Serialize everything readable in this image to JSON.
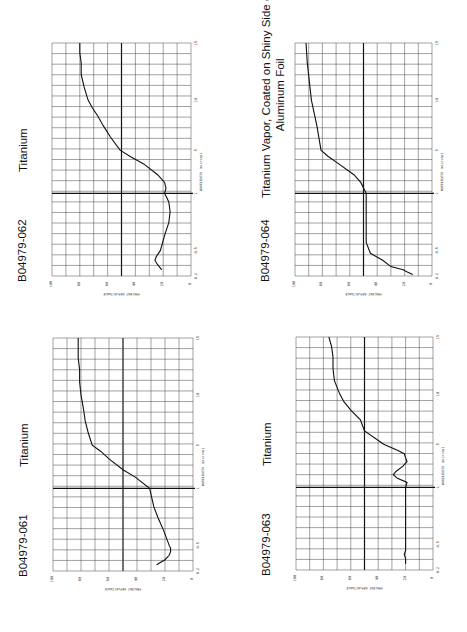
{
  "page": {
    "rotation_deg": -90,
    "background": "#ffffff"
  },
  "charts": [
    {
      "id": "B04979-062",
      "name": "Titanium",
      "name_lines": [
        "Titanium"
      ],
      "box": {
        "left": 52,
        "top": 43,
        "right": 191,
        "bottom": 276
      },
      "points": [
        [
          0.25,
          21
        ],
        [
          0.3,
          24
        ],
        [
          0.35,
          26
        ],
        [
          0.4,
          25
        ],
        [
          0.5,
          22
        ],
        [
          0.6,
          19
        ],
        [
          0.7,
          16
        ],
        [
          0.8,
          15
        ],
        [
          0.9,
          16
        ],
        [
          1.0,
          19
        ],
        [
          1.2,
          18
        ],
        [
          1.5,
          19
        ],
        [
          2,
          24
        ],
        [
          3,
          34
        ],
        [
          4,
          44
        ],
        [
          5,
          51
        ],
        [
          6,
          58
        ],
        [
          7,
          63
        ],
        [
          8,
          67
        ],
        [
          9,
          71
        ],
        [
          10,
          74
        ],
        [
          11,
          77
        ],
        [
          12,
          79
        ],
        [
          13,
          79
        ],
        [
          14,
          80
        ],
        [
          15,
          80
        ]
      ]
    },
    {
      "id": "B04979-064",
      "name": "Titanium Vapor, Coated on Shiny Side of Aluminum Foil",
      "name_lines": [
        "Titanium Vapor, Coated on Shiny Side of",
        "Aluminum Foil"
      ],
      "box": {
        "left": 295,
        "top": 43,
        "right": 432,
        "bottom": 276
      },
      "points": [
        [
          0.21,
          14
        ],
        [
          0.23,
          18
        ],
        [
          0.25,
          21
        ],
        [
          0.28,
          30
        ],
        [
          0.35,
          36
        ],
        [
          0.45,
          45
        ],
        [
          0.55,
          48
        ],
        [
          1.0,
          48
        ],
        [
          1.5,
          52
        ],
        [
          2,
          57
        ],
        [
          3,
          68
        ],
        [
          4,
          76
        ],
        [
          5,
          81
        ],
        [
          7,
          84
        ],
        [
          10,
          88
        ],
        [
          13,
          91
        ],
        [
          15,
          92
        ]
      ]
    },
    {
      "id": "B04979-061",
      "name": "Titanium",
      "name_lines": [
        "Titanium"
      ],
      "box": {
        "left": 53,
        "top": 338,
        "right": 193,
        "bottom": 571
      },
      "points": [
        [
          0.25,
          26
        ],
        [
          0.3,
          20
        ],
        [
          0.35,
          17
        ],
        [
          0.4,
          16
        ],
        [
          0.45,
          16
        ],
        [
          0.5,
          17
        ],
        [
          0.6,
          21
        ],
        [
          0.7,
          25
        ],
        [
          0.8,
          28
        ],
        [
          1.0,
          31
        ],
        [
          1.5,
          41
        ],
        [
          2,
          50
        ],
        [
          3,
          60
        ],
        [
          4,
          66
        ],
        [
          5,
          72
        ],
        [
          6,
          75
        ],
        [
          7,
          77
        ],
        [
          8,
          78
        ],
        [
          9,
          79
        ],
        [
          10,
          80
        ],
        [
          11,
          81
        ],
        [
          12,
          81
        ],
        [
          13,
          82
        ],
        [
          14,
          82
        ],
        [
          15,
          82
        ]
      ]
    },
    {
      "id": "B04979-063",
      "name": "Titanium",
      "name_lines": [
        "Titanium"
      ],
      "box": {
        "left": 296,
        "top": 337,
        "right": 433,
        "bottom": 570
      },
      "points": [
        [
          0.25,
          20
        ],
        [
          0.3,
          20
        ],
        [
          0.35,
          21
        ],
        [
          0.4,
          20
        ],
        [
          0.5,
          20
        ],
        [
          0.7,
          20
        ],
        [
          1.0,
          20
        ],
        [
          1.2,
          19
        ],
        [
          1.4,
          26
        ],
        [
          1.6,
          29
        ],
        [
          1.8,
          27
        ],
        [
          2.2,
          22
        ],
        [
          2.6,
          19
        ],
        [
          3,
          20
        ],
        [
          3.5,
          21
        ],
        [
          4,
          26
        ],
        [
          5,
          36
        ],
        [
          6,
          50
        ],
        [
          7,
          53
        ],
        [
          8,
          60
        ],
        [
          9,
          65
        ],
        [
          10,
          68
        ],
        [
          11,
          72
        ],
        [
          12,
          73
        ],
        [
          13,
          73
        ],
        [
          14,
          74
        ],
        [
          15,
          76
        ]
      ]
    }
  ],
  "axes": {
    "wavelength_label": "WAVELENGTH",
    "wavelength_unit": "(microns)",
    "wavelength_ticks": [
      {
        "v": 0.2,
        "label": "0.2",
        "frac": 0.0
      },
      {
        "v": 0.5,
        "label": "0.5",
        "frac": 0.11
      },
      {
        "v": 1,
        "label": "1",
        "frac": 0.355
      },
      {
        "v": 5,
        "label": "5",
        "frac": 0.54
      },
      {
        "v": 10,
        "label": "10",
        "frac": 0.755
      },
      {
        "v": 15,
        "label": "15",
        "frac": 1.0
      }
    ],
    "reflectance_label": "PERCENT REFLECTANCE",
    "reflectance_ticks": [
      "100",
      "80",
      "60",
      "40",
      "20",
      "0"
    ]
  },
  "chart_data": [
    {
      "type": "line",
      "title": "B04979-062 Titanium",
      "xlabel": "WAVELENGTH (microns)",
      "ylabel": "PERCENT REFLECTANCE",
      "xlim": [
        0.2,
        15
      ],
      "ylim": [
        0,
        100
      ],
      "x_ticks": [
        0.2,
        0.5,
        1,
        5,
        10,
        15
      ],
      "y_ticks": [
        0,
        20,
        40,
        60,
        80,
        100
      ],
      "grid": true,
      "x": [
        0.25,
        0.3,
        0.35,
        0.4,
        0.5,
        0.6,
        0.7,
        0.8,
        0.9,
        1.0,
        1.2,
        1.5,
        2,
        3,
        4,
        5,
        6,
        7,
        8,
        9,
        10,
        11,
        12,
        13,
        14,
        15
      ],
      "y": [
        21,
        24,
        26,
        25,
        22,
        19,
        16,
        15,
        16,
        19,
        18,
        19,
        24,
        34,
        44,
        51,
        58,
        63,
        67,
        71,
        74,
        77,
        79,
        79,
        80,
        80
      ]
    },
    {
      "type": "line",
      "title": "B04979-064 Titanium Vapor, Coated on Shiny Side of Aluminum Foil",
      "xlabel": "WAVELENGTH (microns)",
      "ylabel": "PERCENT REFLECTANCE",
      "xlim": [
        0.2,
        15
      ],
      "ylim": [
        0,
        100
      ],
      "x_ticks": [
        0.2,
        0.5,
        1,
        5,
        10,
        15
      ],
      "y_ticks": [
        0,
        20,
        40,
        60,
        80,
        100
      ],
      "grid": true,
      "x": [
        0.21,
        0.23,
        0.25,
        0.28,
        0.35,
        0.45,
        0.55,
        1.0,
        1.5,
        2,
        3,
        4,
        5,
        7,
        10,
        13,
        15
      ],
      "y": [
        14,
        18,
        21,
        30,
        36,
        45,
        48,
        48,
        52,
        57,
        68,
        76,
        81,
        84,
        88,
        91,
        92
      ]
    },
    {
      "type": "line",
      "title": "B04979-061 Titanium",
      "xlabel": "WAVELENGTH (microns)",
      "ylabel": "PERCENT REFLECTANCE",
      "xlim": [
        0.2,
        15
      ],
      "ylim": [
        0,
        100
      ],
      "x_ticks": [
        0.2,
        0.5,
        1,
        5,
        10,
        15
      ],
      "y_ticks": [
        0,
        20,
        40,
        60,
        80,
        100
      ],
      "grid": true,
      "x": [
        0.25,
        0.3,
        0.35,
        0.4,
        0.45,
        0.5,
        0.6,
        0.7,
        0.8,
        1.0,
        1.5,
        2,
        3,
        4,
        5,
        6,
        7,
        8,
        9,
        10,
        11,
        12,
        13,
        14,
        15
      ],
      "y": [
        26,
        20,
        17,
        16,
        16,
        17,
        21,
        25,
        28,
        31,
        41,
        50,
        60,
        66,
        72,
        75,
        77,
        78,
        79,
        80,
        81,
        81,
        82,
        82,
        82
      ]
    },
    {
      "type": "line",
      "title": "B04979-063 Titanium",
      "xlabel": "WAVELENGTH (microns)",
      "ylabel": "PERCENT REFLECTANCE",
      "xlim": [
        0.2,
        15
      ],
      "ylim": [
        0,
        100
      ],
      "x_ticks": [
        0.2,
        0.5,
        1,
        5,
        10,
        15
      ],
      "y_ticks": [
        0,
        20,
        40,
        60,
        80,
        100
      ],
      "grid": true,
      "x": [
        0.25,
        0.3,
        0.35,
        0.4,
        0.5,
        0.7,
        1.0,
        1.2,
        1.4,
        1.6,
        1.8,
        2.2,
        2.6,
        3,
        3.5,
        4,
        5,
        6,
        7,
        8,
        9,
        10,
        11,
        12,
        13,
        14,
        15
      ],
      "y": [
        20,
        20,
        21,
        20,
        20,
        20,
        20,
        19,
        26,
        29,
        27,
        22,
        19,
        20,
        21,
        26,
        36,
        50,
        53,
        60,
        65,
        68,
        72,
        73,
        73,
        74,
        76
      ]
    }
  ]
}
